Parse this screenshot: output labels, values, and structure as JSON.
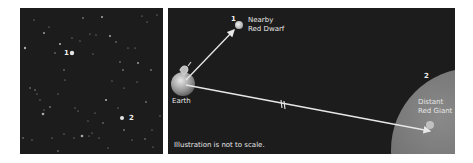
{
  "left_panel": {
    "title": "starfield",
    "markers": [
      {
        "label": "1",
        "x": 44,
        "y": 45
      },
      {
        "label": "2",
        "x": 109,
        "y": 110
      }
    ],
    "stars": [
      [
        5,
        40,
        1.2
      ],
      [
        14,
        12,
        0.6
      ],
      [
        24,
        25,
        0.9
      ],
      [
        29,
        19,
        0.6
      ],
      [
        35,
        45,
        0.7
      ],
      [
        40,
        36,
        1.1
      ],
      [
        44,
        62,
        0.7
      ],
      [
        52,
        30,
        0.6
      ],
      [
        60,
        33,
        0.6
      ],
      [
        63,
        10,
        0.8
      ],
      [
        70,
        26,
        0.6
      ],
      [
        73,
        46,
        0.6
      ],
      [
        76,
        27,
        0.6
      ],
      [
        82,
        9,
        1.0
      ],
      [
        90,
        28,
        1.0
      ],
      [
        96,
        34,
        0.7
      ],
      [
        100,
        54,
        0.7
      ],
      [
        103,
        62,
        0.8
      ],
      [
        108,
        40,
        0.6
      ],
      [
        115,
        40,
        0.6
      ],
      [
        118,
        55,
        0.9
      ],
      [
        122,
        8,
        0.6
      ],
      [
        127,
        14,
        0.6
      ],
      [
        131,
        62,
        0.8
      ],
      [
        137,
        7,
        0.6
      ],
      [
        10,
        80,
        0.7
      ],
      [
        15,
        82,
        0.7
      ],
      [
        17,
        86,
        0.6
      ],
      [
        20,
        92,
        0.6
      ],
      [
        24,
        102,
        0.6
      ],
      [
        30,
        99,
        0.8
      ],
      [
        38,
        86,
        0.6
      ],
      [
        45,
        72,
        0.6
      ],
      [
        55,
        100,
        0.6
      ],
      [
        58,
        103,
        0.6
      ],
      [
        68,
        113,
        0.6
      ],
      [
        75,
        105,
        0.6
      ],
      [
        86,
        92,
        1.1
      ],
      [
        92,
        73,
        0.6
      ],
      [
        98,
        100,
        0.6
      ],
      [
        104,
        80,
        0.6
      ],
      [
        117,
        74,
        0.6
      ],
      [
        126,
        94,
        0.8
      ],
      [
        132,
        122,
        0.6
      ],
      [
        3,
        130,
        0.7
      ],
      [
        12,
        132,
        0.6
      ],
      [
        23,
        106,
        1.3
      ],
      [
        32,
        130,
        0.6
      ],
      [
        38,
        143,
        0.7
      ],
      [
        44,
        126,
        0.6
      ],
      [
        54,
        130,
        0.6
      ],
      [
        62,
        128,
        1.3
      ],
      [
        69,
        128,
        0.6
      ],
      [
        72,
        125,
        0.6
      ],
      [
        79,
        130,
        0.6
      ],
      [
        83,
        115,
        0.7
      ],
      [
        88,
        140,
        0.6
      ],
      [
        104,
        122,
        0.8
      ],
      [
        112,
        132,
        0.6
      ],
      [
        125,
        131,
        0.7
      ],
      [
        133,
        139,
        0.6
      ],
      [
        140,
        108,
        0.6
      ]
    ],
    "highlight_stars": [
      {
        "id": "1",
        "x": 52,
        "y": 45,
        "r": 2.2
      },
      {
        "id": "2",
        "x": 102,
        "y": 110,
        "r": 2.0
      }
    ]
  },
  "right_panel": {
    "earth": {
      "label": "Earth",
      "cx": 15,
      "cy": 76,
      "r": 12
    },
    "nearby_red_dwarf": {
      "number": "1",
      "line1": "Nearby",
      "line2": "Red Dwarf",
      "cx": 71,
      "cy": 17,
      "r": 4
    },
    "distant_red_giant": {
      "number": "2",
      "line1": "Distant",
      "line2": "Red Giant",
      "cx": 305,
      "cy": 142,
      "r": 82
    },
    "note": "Illustration is not to scale.",
    "colors": {
      "background": "#1c1c1c",
      "arrow": "#e8e8e8",
      "giant": "#6e6e6e",
      "dwarf": "#d0d0d0",
      "text": "#e6e6e6"
    }
  }
}
